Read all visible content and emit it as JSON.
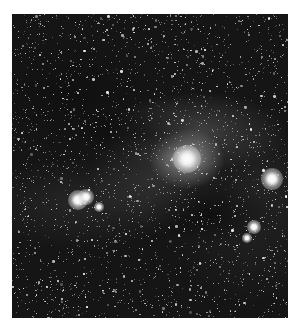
{
  "image": {
    "subject": "nebula-star-field",
    "description": "Grayscale astrophotograph of a reflection/dark nebula region dense with stars",
    "colors": {
      "page_background": "#ffffff",
      "sky": "#151515",
      "nebula_core": "#ebebeb",
      "star": "#ffffff"
    },
    "bright_stars": [
      {
        "x": 175,
        "y": 145,
        "r": 14
      },
      {
        "x": 66,
        "y": 186,
        "r": 10
      },
      {
        "x": 74,
        "y": 183,
        "r": 8
      },
      {
        "x": 87,
        "y": 193,
        "r": 5
      },
      {
        "x": 260,
        "y": 165,
        "r": 11
      },
      {
        "x": 242,
        "y": 213,
        "r": 7
      },
      {
        "x": 235,
        "y": 224,
        "r": 5
      }
    ],
    "star_field": {
      "count": 2600,
      "seed": 7
    }
  }
}
